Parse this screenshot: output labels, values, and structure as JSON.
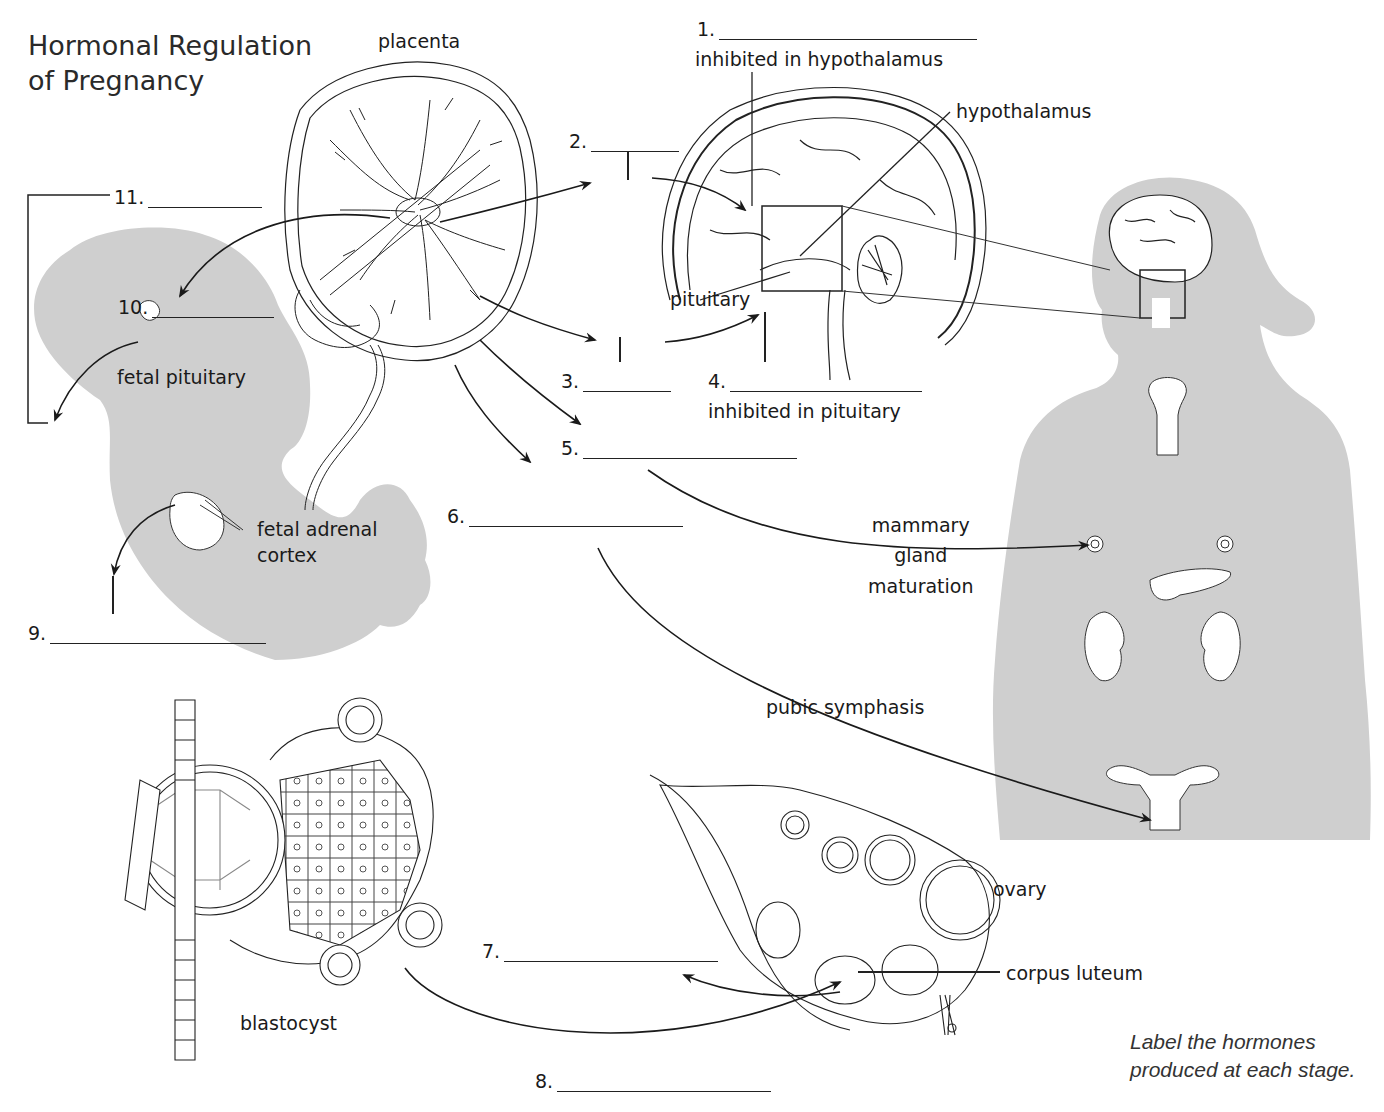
{
  "title": {
    "line1": "Hormonal Regulation",
    "line2": "of Pregnancy"
  },
  "instruction": {
    "line1": "Label the hormones",
    "line2": "produced at each stage."
  },
  "structures": {
    "placenta": "placenta",
    "hypothalamus": "hypothalamus",
    "pituitary": "pituitary",
    "fetal_pituitary": "fetal pituitary",
    "fetal_adrenal_line1": "fetal adrenal",
    "fetal_adrenal_line2": "cortex",
    "mammary_line1": "mammary",
    "mammary_line2": "gland",
    "mammary_line3": "maturation",
    "pubic_symphasis": "pubic symphasis",
    "ovary": "ovary",
    "corpus_luteum": "corpus luteum",
    "blastocyst": "blastocyst"
  },
  "annotations": {
    "inhibited_hypothalamus": "inhibited in hypothalamus",
    "inhibited_pituitary": "inhibited in pituitary"
  },
  "blanks": [
    {
      "number": "1.",
      "value": ""
    },
    {
      "number": "2.",
      "value": ""
    },
    {
      "number": "3.",
      "value": ""
    },
    {
      "number": "4.",
      "value": ""
    },
    {
      "number": "5.",
      "value": ""
    },
    {
      "number": "6.",
      "value": ""
    },
    {
      "number": "7.",
      "value": ""
    },
    {
      "number": "8.",
      "value": ""
    },
    {
      "number": "9.",
      "value": ""
    },
    {
      "number": "10.",
      "value": ""
    },
    {
      "number": "11.",
      "value": ""
    }
  ],
  "colors": {
    "silhouette": "#cfcfcf",
    "ink": "#1a1a1a",
    "background": "#ffffff"
  }
}
